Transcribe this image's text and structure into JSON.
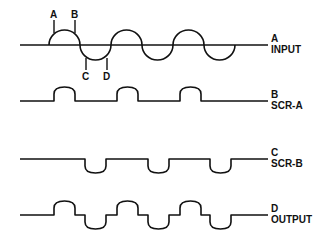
{
  "diagram": {
    "type": "waveform-timing",
    "colors": {
      "line": "#111111",
      "background": "#ffffff"
    },
    "point_labels": [
      "A",
      "B",
      "C",
      "D"
    ],
    "traces": [
      {
        "id": "input",
        "letter": "A",
        "name": "INPUT",
        "kind": "full-sine",
        "cycles": 3
      },
      {
        "id": "scr_a",
        "letter": "B",
        "name": "SCR-A",
        "kind": "positive-pulses",
        "pulses": 3
      },
      {
        "id": "scr_b",
        "letter": "C",
        "name": "SCR-B",
        "kind": "negative-pulses",
        "pulses": 3
      },
      {
        "id": "output",
        "letter": "D",
        "name": "OUTPUT",
        "kind": "bidirectional-pulses",
        "pulses": 6
      }
    ]
  }
}
